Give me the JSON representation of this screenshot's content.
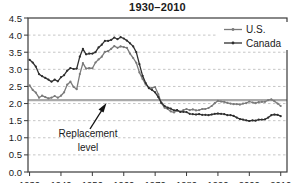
{
  "title": "1930–2010",
  "legend": {
    "items": [
      {
        "label": "U.S."
      },
      {
        "label": "Canada"
      }
    ]
  },
  "annotation": {
    "line1": "Replacement",
    "line2": "level"
  },
  "colors": {
    "us_line": "#7a7a7a",
    "canada_line": "#2f2f2f",
    "grid": "#c6c6c6",
    "replacement_line": "#aaaaaa",
    "frame": "#3a3a3a",
    "text": "#1a1a1a"
  },
  "chart_data": {
    "type": "line",
    "title": "1930–2010",
    "xlabel": "",
    "ylabel": "",
    "xlim": [
      1929.5,
      2012
    ],
    "ylim": [
      0,
      4.5
    ],
    "grid": true,
    "legend_position": "top-right",
    "yticks": [
      "0.0",
      "0.5",
      "1.0",
      "1.5",
      "2.0",
      "2.5",
      "3.0",
      "3.5",
      "4.0",
      "4.5"
    ],
    "xticks": [
      "1930",
      "1940",
      "1950",
      "1960",
      "1970",
      "1980",
      "1990",
      "2000",
      "2010"
    ],
    "reference_line": {
      "value": 2.1,
      "label": "Replacement level"
    },
    "x": [
      1930,
      1931,
      1932,
      1933,
      1934,
      1935,
      1936,
      1937,
      1938,
      1939,
      1940,
      1941,
      1942,
      1943,
      1944,
      1945,
      1946,
      1947,
      1948,
      1949,
      1950,
      1951,
      1952,
      1953,
      1954,
      1955,
      1956,
      1957,
      1958,
      1959,
      1960,
      1961,
      1962,
      1963,
      1964,
      1965,
      1966,
      1967,
      1968,
      1969,
      1970,
      1971,
      1972,
      1973,
      1974,
      1975,
      1976,
      1977,
      1978,
      1979,
      1980,
      1981,
      1982,
      1983,
      1984,
      1985,
      1986,
      1987,
      1988,
      1989,
      1990,
      1991,
      1992,
      1993,
      1994,
      1995,
      1996,
      1997,
      1998,
      1999,
      2000,
      2001,
      2002,
      2003,
      2004,
      2005,
      2006,
      2007,
      2008,
      2009,
      2010
    ],
    "series": [
      {
        "name": "U.S.",
        "values": [
          2.53,
          2.4,
          2.32,
          2.17,
          2.23,
          2.19,
          2.15,
          2.17,
          2.22,
          2.17,
          2.23,
          2.33,
          2.55,
          2.64,
          2.49,
          2.42,
          2.86,
          3.18,
          3.02,
          3.04,
          3.03,
          3.2,
          3.29,
          3.37,
          3.51,
          3.53,
          3.6,
          3.68,
          3.63,
          3.67,
          3.65,
          3.63,
          3.46,
          3.33,
          3.19,
          2.91,
          2.72,
          2.56,
          2.46,
          2.46,
          2.48,
          2.27,
          2.01,
          1.88,
          1.84,
          1.77,
          1.74,
          1.79,
          1.76,
          1.81,
          1.84,
          1.81,
          1.83,
          1.8,
          1.81,
          1.84,
          1.84,
          1.87,
          1.93,
          2.01,
          2.08,
          2.06,
          2.05,
          2.02,
          2.0,
          1.98,
          1.98,
          1.97,
          2.0,
          2.01,
          2.06,
          2.03,
          2.01,
          2.04,
          2.05,
          2.05,
          2.1,
          2.12,
          2.07,
          2.0,
          1.93
        ]
      },
      {
        "name": "Canada",
        "values": [
          3.28,
          3.2,
          3.08,
          2.86,
          2.8,
          2.75,
          2.7,
          2.64,
          2.7,
          2.65,
          2.77,
          2.83,
          2.96,
          3.04,
          3.01,
          3.02,
          3.37,
          3.6,
          3.44,
          3.46,
          3.46,
          3.5,
          3.64,
          3.72,
          3.83,
          3.83,
          3.86,
          3.93,
          3.88,
          3.94,
          3.9,
          3.84,
          3.76,
          3.67,
          3.5,
          3.15,
          2.81,
          2.6,
          2.45,
          2.4,
          2.33,
          2.19,
          2.02,
          1.93,
          1.88,
          1.85,
          1.8,
          1.81,
          1.76,
          1.76,
          1.75,
          1.7,
          1.69,
          1.68,
          1.69,
          1.67,
          1.67,
          1.66,
          1.68,
          1.7,
          1.71,
          1.7,
          1.69,
          1.66,
          1.66,
          1.64,
          1.59,
          1.55,
          1.53,
          1.51,
          1.49,
          1.51,
          1.5,
          1.53,
          1.53,
          1.54,
          1.59,
          1.66,
          1.68,
          1.67,
          1.63
        ]
      }
    ]
  }
}
